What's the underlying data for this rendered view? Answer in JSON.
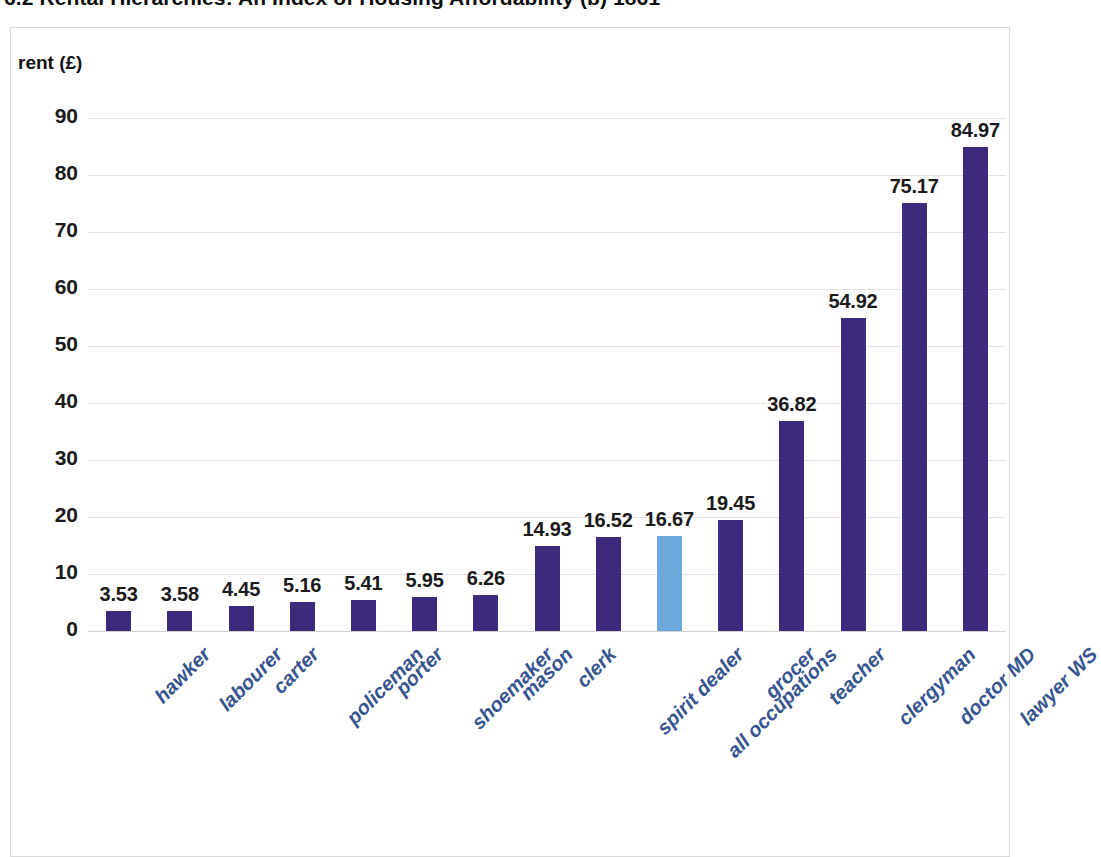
{
  "title": "6.2 Rental Hierarchies: An Index of Housing Affordability (b) 1861",
  "colors": {
    "bar_default": "#3d2a7d",
    "bar_highlight": "#6ba8dc",
    "category_label": "#36548f",
    "gridline": "#e2e2e2",
    "frame": "#d9d9d9",
    "value_label": "#1a1a1a"
  },
  "chart_data": {
    "type": "bar",
    "title": "6.2 Rental Hierarchies: An Index of Housing Affordability (b) 1861",
    "xlabel": "",
    "ylabel": "rent (£)",
    "ylim": [
      0,
      90
    ],
    "yticks": [
      0,
      10,
      20,
      30,
      40,
      50,
      60,
      70,
      80,
      90
    ],
    "grid": true,
    "legend": "none",
    "highlight_category": "all occupations",
    "categories": [
      "hawker",
      "labourer",
      "carter",
      "policeman",
      "porter",
      "shoemaker",
      "mason",
      "clerk",
      "spirit dealer",
      "all occupations",
      "grocer",
      "teacher",
      "clergyman",
      "doctor MD",
      "lawyer WS"
    ],
    "values": [
      3.53,
      3.58,
      4.45,
      5.16,
      5.41,
      5.95,
      6.26,
      14.93,
      16.52,
      16.67,
      19.45,
      36.82,
      54.92,
      75.17,
      84.97
    ],
    "value_labels": [
      "3.53",
      "3.58",
      "4.45",
      "5.16",
      "5.41",
      "5.95",
      "6.26",
      "14.93",
      "16.52",
      "16.67",
      "19.45",
      "36.82",
      "54.92",
      "75.17",
      "84.97"
    ]
  }
}
